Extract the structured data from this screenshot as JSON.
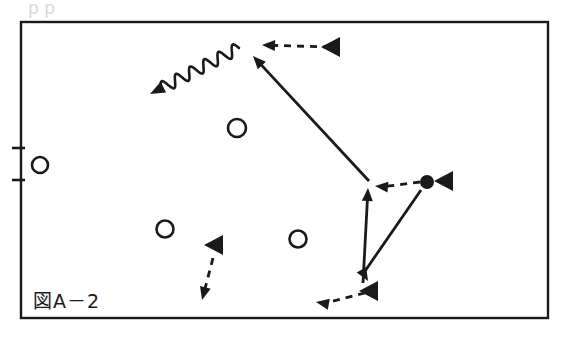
{
  "figure": {
    "caption": "図A－2",
    "caption_position": {
      "x": 33,
      "y": 308
    },
    "background_color": "#ffffff",
    "ink_color": "#1a1a1a",
    "ghost_color": "#d8d8d8",
    "partial_top_text": "p p",
    "frame": {
      "x": 21,
      "y": 22,
      "width": 527,
      "height": 296,
      "stroke_width": 2.4
    },
    "axis_ticks": [
      {
        "name": "tick-upper",
        "x1": 12,
        "y1": 148,
        "x2": 25,
        "y2": 148
      },
      {
        "name": "tick-lower",
        "x1": 12,
        "y1": 180,
        "x2": 25,
        "y2": 180
      }
    ],
    "open_circles": [
      {
        "name": "open-circle-left",
        "cx": 40,
        "cy": 165,
        "r": 8
      },
      {
        "name": "open-circle-upper-middle",
        "cx": 237,
        "cy": 128,
        "r": 9
      },
      {
        "name": "open-circle-lower-left",
        "cx": 165,
        "cy": 229,
        "r": 8.5
      },
      {
        "name": "open-circle-lower-middle",
        "cx": 298,
        "cy": 239,
        "r": 8.5
      }
    ],
    "filled_dots": [
      {
        "name": "filled-dot-right",
        "cx": 427,
        "cy": 182,
        "r": 7
      }
    ],
    "solid_arrows": [
      {
        "name": "solid-arrow-long-diagonal",
        "x1": 369,
        "y1": 181,
        "x2": 253,
        "y2": 56,
        "head_angle": -133
      },
      {
        "name": "solid-arrow-vertical-up",
        "x1": 363,
        "y1": 283,
        "x2": 368,
        "y2": 188,
        "head_angle": -87
      },
      {
        "name": "solid-arrow-diagonal-down-left",
        "x1": 421,
        "y1": 190,
        "x2": 368,
        "y2": 281,
        "head_angle": 60
      }
    ],
    "dashed_arrows": [
      {
        "name": "dashed-arrow-top",
        "x1": 330,
        "y1": 47,
        "x2": 262,
        "y2": 45,
        "head_angle": 182,
        "tail_triangle": {
          "cx": 338,
          "cy": 47,
          "angle": 180
        }
      },
      {
        "name": "dashed-arrow-right-to-dot",
        "x1": 420,
        "y1": 182,
        "x2": 375,
        "y2": 186,
        "head_angle": 185,
        "tail_triangle": {
          "cx": 451,
          "cy": 181,
          "angle": 180
        }
      },
      {
        "name": "dashed-arrow-bottom",
        "x1": 365,
        "y1": 293,
        "x2": 316,
        "y2": 302,
        "head_angle": 190,
        "tail_triangle": {
          "cx": 376,
          "cy": 291,
          "angle": 180
        }
      },
      {
        "name": "dashed-arrow-down-left",
        "x1": 213,
        "y1": 258,
        "x2": 202,
        "y2": 300,
        "head_angle": 105,
        "tail_triangle": {
          "cx": 221,
          "cy": 245,
          "angle": 180
        }
      }
    ],
    "wavy_arrows": [
      {
        "name": "wavy-arrow-upper-left",
        "x1": 239,
        "y1": 48,
        "x2": 150,
        "y2": 94,
        "head_angle": 153,
        "amplitude": 6,
        "wavelength": 16
      }
    ]
  }
}
